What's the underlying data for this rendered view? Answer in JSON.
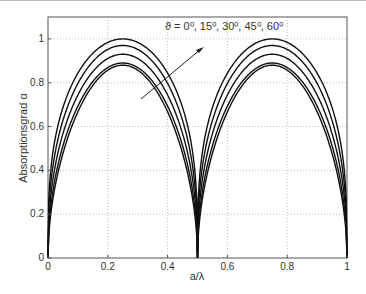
{
  "chart_data": {
    "type": "line",
    "title": "",
    "xlabel": "a/λ",
    "ylabel": "Absorptionsgrad   α",
    "xlim": [
      0,
      1
    ],
    "ylim": [
      0,
      1.1
    ],
    "grid": true,
    "xticks": [
      "0",
      "0.2",
      "0.4",
      "0.6",
      "0.8",
      "1"
    ],
    "yticks": [
      "0",
      "0.2",
      "0.4",
      "0.6",
      "0.8",
      "1"
    ],
    "annotation": "ϑ = 0⁰,  15⁰,  30⁰,  45⁰,  60⁰",
    "legend_position": "none",
    "series": [
      {
        "name": "ϑ = 0°",
        "peak": 1.0,
        "x": [
          0,
          0.05,
          0.1,
          0.25,
          0.4,
          0.45,
          0.5,
          0.55,
          0.6,
          0.75,
          0.9,
          0.95,
          1
        ],
        "values": [
          0,
          0.72,
          0.9,
          1.0,
          0.9,
          0.72,
          0,
          0.72,
          0.9,
          1.0,
          0.9,
          0.72,
          0
        ]
      },
      {
        "name": "ϑ = 15°",
        "peak": 0.97,
        "x": [
          0,
          0.05,
          0.1,
          0.25,
          0.4,
          0.45,
          0.5,
          0.55,
          0.6,
          0.75,
          0.9,
          0.95,
          1
        ],
        "values": [
          0,
          0.67,
          0.86,
          0.97,
          0.86,
          0.67,
          0,
          0.67,
          0.86,
          0.97,
          0.86,
          0.67,
          0
        ]
      },
      {
        "name": "ϑ = 30°",
        "peak": 0.93,
        "x": [
          0,
          0.05,
          0.1,
          0.25,
          0.4,
          0.45,
          0.5,
          0.55,
          0.6,
          0.75,
          0.9,
          0.95,
          1
        ],
        "values": [
          0,
          0.62,
          0.81,
          0.93,
          0.81,
          0.62,
          0,
          0.62,
          0.81,
          0.93,
          0.81,
          0.62,
          0
        ]
      },
      {
        "name": "ϑ = 45°",
        "peak": 0.89,
        "x": [
          0,
          0.05,
          0.1,
          0.25,
          0.4,
          0.45,
          0.5,
          0.55,
          0.6,
          0.75,
          0.9,
          0.95,
          1
        ],
        "values": [
          0,
          0.58,
          0.77,
          0.89,
          0.77,
          0.58,
          0,
          0.58,
          0.77,
          0.89,
          0.77,
          0.58,
          0
        ]
      },
      {
        "name": "ϑ = 60°",
        "peak": 0.88,
        "x": [
          0,
          0.05,
          0.1,
          0.25,
          0.4,
          0.45,
          0.5,
          0.55,
          0.6,
          0.75,
          0.9,
          0.95,
          1
        ],
        "values": [
          0,
          0.55,
          0.75,
          0.88,
          0.75,
          0.55,
          0,
          0.55,
          0.75,
          0.88,
          0.75,
          0.55,
          0
        ]
      }
    ]
  }
}
